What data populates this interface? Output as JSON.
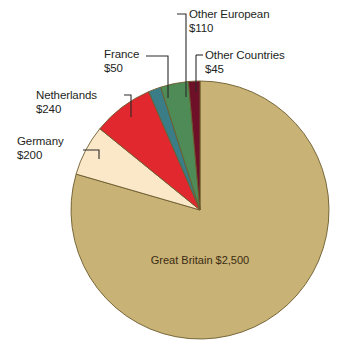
{
  "chart_data": {
    "type": "pie",
    "title": "",
    "subtitle": "",
    "xlabel": "",
    "ylabel": "",
    "legend_position": "none",
    "grid": false,
    "units": "US dollars (millions)",
    "value_prefix": "$",
    "total": 3145,
    "categories": [
      "Great Britain",
      "Germany",
      "Netherlands",
      "France",
      "Other European",
      "Other Countries"
    ],
    "values": [
      2500,
      200,
      240,
      50,
      110,
      45
    ],
    "value_labels": [
      "$2,500",
      "$200",
      "$240",
      "$50",
      "$110",
      "$45"
    ],
    "colors": [
      "#C9B275",
      "#FAE8C8",
      "#E1282E",
      "#3A7D86",
      "#4E8B56",
      "#6E1028"
    ],
    "start_angle_deg": 0,
    "direction": "clockwise",
    "slices": [
      {
        "name": "Great Britain",
        "value": 2500,
        "value_label": "$2,500",
        "color": "#C9B275",
        "label_placement": "inside",
        "start_deg": 0.0,
        "end_deg": 286.2
      },
      {
        "name": "Germany",
        "value": 200,
        "value_label": "$200",
        "color": "#FAE8C8",
        "label_placement": "leader-left",
        "start_deg": 286.2,
        "end_deg": 309.1
      },
      {
        "name": "Netherlands",
        "value": 240,
        "value_label": "$240",
        "color": "#E1282E",
        "label_placement": "leader-left",
        "start_deg": 309.1,
        "end_deg": 336.6
      },
      {
        "name": "France",
        "value": 50,
        "value_label": "$50",
        "color": "#3A7D86",
        "label_placement": "leader-top",
        "start_deg": 336.6,
        "end_deg": 342.3
      },
      {
        "name": "Other European",
        "value": 110,
        "value_label": "$110",
        "color": "#4E8B56",
        "label_placement": "leader-top",
        "start_deg": 342.3,
        "end_deg": 354.9
      },
      {
        "name": "Other Countries",
        "value": 45,
        "value_label": "$45",
        "color": "#6E1028",
        "label_placement": "leader-top",
        "start_deg": 354.9,
        "end_deg": 360.0
      }
    ]
  },
  "labels": {
    "great_britain": {
      "name": "Great Britain",
      "value": "$2,500"
    },
    "germany": {
      "name": "Germany",
      "value": "$200"
    },
    "netherlands": {
      "name": "Netherlands",
      "value": "$240"
    },
    "france": {
      "name": "France",
      "value": "$50"
    },
    "other_european": {
      "name": "Other European",
      "value": "$110"
    },
    "other_countries": {
      "name": "Other Countries",
      "value": "$45"
    }
  },
  "style": {
    "background": "#FFFFFF",
    "outline": "#6B5B2E",
    "leader_line": "#2B2B2B",
    "text": "#231F1C",
    "inner_text": "#3A2C14"
  },
  "geometry": {
    "center_x": 200,
    "center_y": 210,
    "radius": 129
  }
}
